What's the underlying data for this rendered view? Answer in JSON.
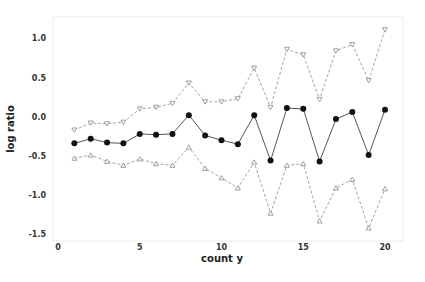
{
  "chart_data": {
    "type": "line",
    "title": "",
    "xlabel": "count y",
    "ylabel": "log ratio",
    "xlim": [
      0,
      21
    ],
    "ylim": [
      -1.55,
      1.25
    ],
    "xticks": [
      0,
      5,
      10,
      15,
      20
    ],
    "xtick_labels": [
      "0",
      "5",
      "10",
      "15",
      "20"
    ],
    "yticks": [
      1.0,
      0.5,
      0.0,
      -0.5,
      -1.0,
      -1.5
    ],
    "ytick_labels": [
      "1.0",
      "0.5",
      "0.0",
      "-0.5",
      "-1.0",
      "-1.5"
    ],
    "grid": false,
    "legend": null,
    "x": [
      1,
      2,
      3,
      4,
      5,
      6,
      7,
      8,
      9,
      10,
      11,
      12,
      13,
      14,
      15,
      16,
      17,
      18,
      19,
      20
    ],
    "series": [
      {
        "name": "upper",
        "style": "dashed",
        "marker": "triangle-down-open",
        "color": "#8a8a8a",
        "values": [
          -0.17,
          -0.08,
          -0.09,
          -0.07,
          0.1,
          0.12,
          0.17,
          0.43,
          0.19,
          0.19,
          0.23,
          0.62,
          0.12,
          0.86,
          0.79,
          0.22,
          0.84,
          0.92,
          0.46,
          1.11
        ]
      },
      {
        "name": "estimate",
        "style": "solid",
        "marker": "circle-filled",
        "color": "#111111",
        "values": [
          -0.34,
          -0.28,
          -0.33,
          -0.34,
          -0.22,
          -0.23,
          -0.22,
          0.02,
          -0.24,
          -0.3,
          -0.35,
          0.02,
          -0.56,
          0.11,
          0.1,
          -0.57,
          -0.03,
          0.06,
          -0.49,
          0.09
        ]
      },
      {
        "name": "lower",
        "style": "dashed",
        "marker": "triangle-up-open",
        "color": "#8a8a8a",
        "values": [
          -0.53,
          -0.49,
          -0.57,
          -0.62,
          -0.54,
          -0.6,
          -0.62,
          -0.39,
          -0.66,
          -0.78,
          -0.91,
          -0.58,
          -1.23,
          -0.62,
          -0.6,
          -1.33,
          -0.91,
          -0.8,
          -1.42,
          -0.92
        ]
      }
    ]
  }
}
